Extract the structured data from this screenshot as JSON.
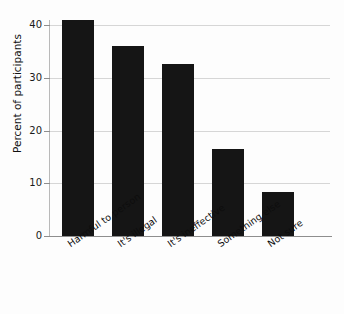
{
  "chart_data": {
    "type": "bar",
    "title": "",
    "subtitle": "",
    "xlabel": "",
    "ylabel": "Percent of participants",
    "categories": [
      "Harmful to person",
      "It's illegal",
      "It's ineffective",
      "Something else",
      "Not sure"
    ],
    "values": [
      41.0,
      36.0,
      32.6,
      16.5,
      8.3
    ],
    "ylim": [
      0,
      42
    ],
    "yticks": [
      0,
      10,
      20,
      30,
      40
    ],
    "ytick_labels": [
      "0",
      "10",
      "20",
      "30",
      "40"
    ],
    "grid": "horizontal",
    "legend": "none",
    "bar_color": "#151515",
    "gridline_color": "#d6d6d6",
    "axis_color": "#8e8e8e",
    "background_color": "#fdfdfd"
  },
  "axes": {
    "y_title": "Percent of participants"
  }
}
